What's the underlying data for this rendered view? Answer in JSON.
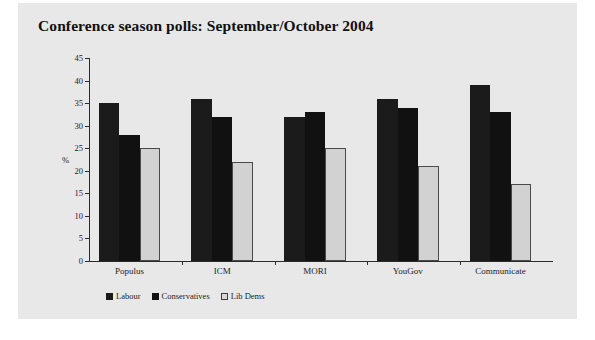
{
  "chart_data": {
    "type": "bar",
    "title": "Conference season polls: September/October 2004",
    "xlabel": "",
    "ylabel": "%",
    "ylim": [
      0,
      45
    ],
    "yticks": [
      0,
      5,
      10,
      15,
      20,
      25,
      30,
      35,
      40,
      45
    ],
    "grid": false,
    "legend_position": "bottom-left",
    "categories": [
      "Populus",
      "ICM",
      "MORI",
      "YouGov",
      "Communicate"
    ],
    "series": [
      {
        "name": "Labour",
        "color": "#1b1b1b",
        "values": [
          35,
          36,
          32,
          36,
          39
        ]
      },
      {
        "name": "Conservatives",
        "color": "#111111",
        "values": [
          28,
          32,
          33,
          34,
          33
        ]
      },
      {
        "name": "Lib Dems",
        "color": "#d2d2d2",
        "values": [
          25,
          22,
          25,
          21,
          17
        ]
      }
    ]
  },
  "figure": {
    "background_color": "#e8e8e8",
    "page_background_color": "#ffffff",
    "axis_color": "#2b2b2b"
  }
}
